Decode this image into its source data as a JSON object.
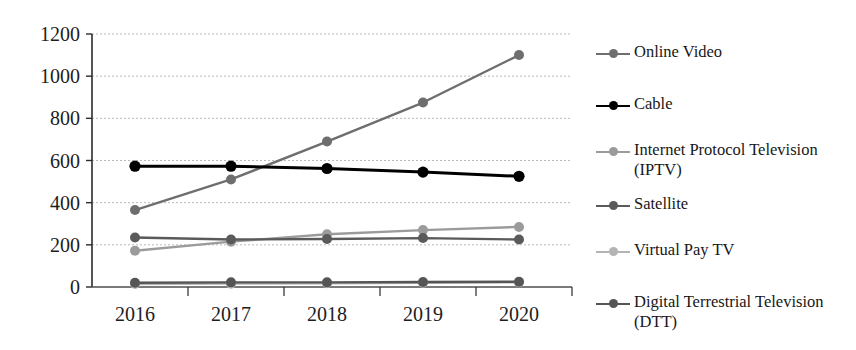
{
  "chart_data": {
    "type": "line",
    "title": "",
    "xlabel": "",
    "ylabel": "",
    "categories": [
      "2016",
      "2017",
      "2018",
      "2019",
      "2020"
    ],
    "ylim": [
      0,
      1200
    ],
    "yticks": [
      0,
      200,
      400,
      600,
      800,
      1000,
      1200
    ],
    "ytick_labels": [
      "0",
      "200",
      "400",
      "600",
      "800",
      "1000",
      "1200"
    ],
    "grid": true,
    "grid_style": "dotted-horizontal",
    "legend_position": "right",
    "series": [
      {
        "name": "Online Video",
        "color": "#6e6e6e",
        "values": [
          365,
          510,
          690,
          875,
          1100
        ]
      },
      {
        "name": "Cable",
        "color": "#000000",
        "values": [
          573,
          573,
          562,
          545,
          525
        ]
      },
      {
        "name": "Internet Protocol Television (IPTV)",
        "color": "#9b9b9b",
        "values": [
          172,
          215,
          250,
          270,
          285
        ]
      },
      {
        "name": "Satellite",
        "color": "#5a5a5a",
        "values": [
          235,
          225,
          228,
          232,
          225
        ]
      },
      {
        "name": "Virtual Pay TV",
        "color": "#b4b4b4",
        "values": [
          14,
          16,
          18,
          20,
          22
        ]
      },
      {
        "name": "Digital Terrestrial Television (DTT)",
        "color": "#555555",
        "values": [
          20,
          22,
          22,
          24,
          25
        ]
      }
    ]
  },
  "legend": {
    "items": [
      {
        "label": "Online Video",
        "color": "#6e6e6e"
      },
      {
        "label": "Cable",
        "color": "#000000"
      },
      {
        "label": "Internet Protocol Television\n(IPTV)",
        "color": "#9b9b9b"
      },
      {
        "label": "Satellite",
        "color": "#5a5a5a"
      },
      {
        "label": "Virtual Pay TV",
        "color": "#b4b4b4"
      },
      {
        "label": "Digital Terrestrial Television\n(DTT)",
        "color": "#555555"
      }
    ]
  },
  "axis": {
    "y_tick_labels": [
      "1200",
      "1000",
      "800",
      "600",
      "400",
      "200",
      "0"
    ],
    "x_tick_labels": [
      "2016",
      "2017",
      "2018",
      "2019",
      "2020"
    ]
  }
}
